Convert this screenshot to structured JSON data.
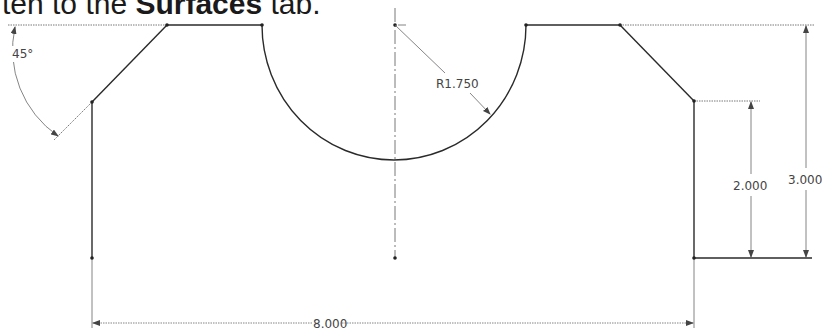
{
  "caption": {
    "prefix": "ten to the ",
    "bold": "Surfaces",
    "suffix": " tab."
  },
  "drawing": {
    "type": "2D sketch profile",
    "dimensions": {
      "angle": "45°",
      "radius": "R1.750",
      "height_overall": "3.000",
      "height_side": "2.000",
      "width_overall": "8.000"
    },
    "colors": {
      "geometry": "#2a2a2a",
      "dimension": "#666666",
      "text": "#444444",
      "background": "#ffffff"
    }
  }
}
